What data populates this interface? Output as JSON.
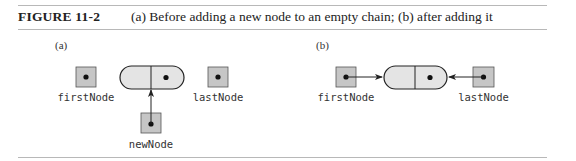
{
  "figure": {
    "number": "FIGURE 11-2",
    "caption": "(a) Before adding a new node to an empty chain; (b) after adding it"
  },
  "colors": {
    "box_fill": "#c6c6c6",
    "node_fill": "#e4e4e4",
    "stroke": "#222222",
    "rule": "#b8b8b8"
  },
  "panels": [
    {
      "label": "(a)",
      "variables": [
        {
          "name": "firstNode",
          "points_to_node": false
        },
        {
          "name": "lastNode",
          "points_to_node": false
        },
        {
          "name": "newNode",
          "points_to_node": true
        }
      ],
      "node": {
        "fields": [
          "data",
          "next"
        ],
        "next_has_dot": true
      }
    },
    {
      "label": "(b)",
      "variables": [
        {
          "name": "firstNode",
          "points_to_node": true
        },
        {
          "name": "lastNode",
          "points_to_node": true
        }
      ],
      "node": {
        "fields": [
          "data",
          "next"
        ],
        "next_has_dot": true
      }
    }
  ]
}
